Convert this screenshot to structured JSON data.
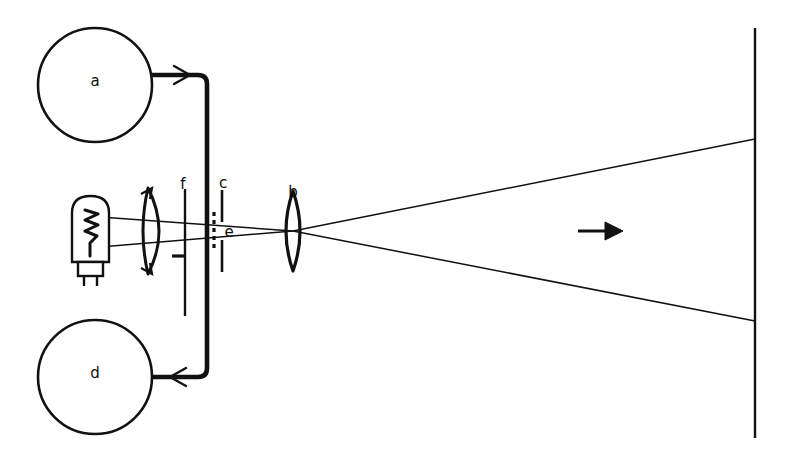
{
  "figure": {
    "type": "line-diagram",
    "background_color": "#ffffff",
    "ink_color": "#111111",
    "canvas": {
      "width": 786,
      "height": 450
    }
  },
  "labels": {
    "a": "a",
    "b": "b",
    "c": "c",
    "d": "d",
    "e": "e",
    "f": "f"
  },
  "components": {
    "power_circle_top": {
      "label": "a",
      "shape": "circle",
      "cx": 95,
      "cy": 85,
      "r": 57,
      "stroke_width": 2.6,
      "label_x": 95,
      "label_y": 80
    },
    "power_circle_bottom": {
      "label": "d",
      "shape": "circle",
      "cx": 95,
      "cy": 377,
      "r": 57,
      "stroke_width": 2.6,
      "label_x": 95,
      "label_y": 372
    },
    "lamp": {
      "name": "incandescent-lamp",
      "bulb_x": 72,
      "bulb_y": 196,
      "bulb_w": 37,
      "bulb_h": 67,
      "base_x": 78,
      "base_y": 262,
      "base_w": 25,
      "base_h": 14,
      "pins": 2,
      "filament": "zigzag"
    },
    "condenser_lens": {
      "name": "condenser-lens",
      "cx": 154,
      "cy": 231,
      "half_height": 43,
      "bulge": 16,
      "stroke_width": 3.0
    },
    "slit": {
      "label": "f",
      "name": "slit-aperture",
      "x": 185,
      "y_top": 189,
      "y_bottom": 316,
      "tick_y": 256,
      "tick_x_from": 172,
      "tick_x_to": 185,
      "label_x": 183,
      "label_y": 184
    },
    "plates": {
      "label": "c",
      "name": "deflection-plates",
      "plate1_x": 207,
      "plate2_x": 222,
      "upper_y_top": 190,
      "upper_y_bottom": 222,
      "lower_y_top": 240,
      "lower_y_bottom": 272,
      "label_x": 223,
      "label_y": 183
    },
    "dashed_element": {
      "label": "e",
      "name": "dashed-beam-segment",
      "x": 214,
      "y_top": 213,
      "y_bottom": 248,
      "dash": "4 4",
      "label_x": 228,
      "label_y": 232
    },
    "projection_lens": {
      "label": "b",
      "name": "projection-lens",
      "cx": 293,
      "cy": 231,
      "half_height": 40,
      "bulge": 13,
      "stroke_width": 3.0,
      "label_x": 293,
      "label_y": 191
    },
    "screen": {
      "name": "projection-screen",
      "x": 755,
      "y_top": 28,
      "y_bottom": 438,
      "stroke_width": 2.4
    },
    "direction_arrow": {
      "name": "beam-direction-arrow",
      "x_from": 578,
      "x_to": 622,
      "y": 231
    },
    "wire": {
      "name": "circuit-wire",
      "stroke_width": 4.5,
      "top_y": 75,
      "bottom_y": 377,
      "right_x": 207,
      "from_x": 152,
      "corner_radius": 9,
      "arrow_top_x": 186,
      "arrow_bottom_x": 172
    }
  },
  "rays": {
    "upper_from_lamp": {
      "x1": 100,
      "y1": 217,
      "x2": 293,
      "y2": 231
    },
    "lower_from_lamp": {
      "x1": 100,
      "y1": 247,
      "x2": 293,
      "y2": 231
    },
    "upper_to_screen": {
      "x1": 293,
      "y1": 231,
      "x2": 755,
      "y2": 139
    },
    "lower_to_screen": {
      "x1": 293,
      "y1": 231,
      "x2": 755,
      "y2": 321
    },
    "crossover_point": {
      "x": 293,
      "y": 231
    }
  }
}
